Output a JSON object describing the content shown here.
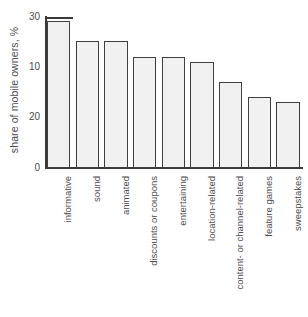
{
  "chart_data": {
    "type": "bar",
    "title": "",
    "subtitle": "",
    "xlabel": "",
    "ylabel": "share of mobile owners, %",
    "ylim": [
      0,
      30
    ],
    "grid": false,
    "legend": "none",
    "y_tick_labels": [
      "30",
      "10",
      "20",
      "0"
    ],
    "y_tick_values": [
      30,
      10,
      20,
      0
    ],
    "categories": [
      "informative",
      "sound",
      "animated",
      "discounts or coupons",
      "entertaining",
      "location-related",
      "content- or channel-related",
      "feature games",
      "sweepstakes"
    ],
    "values": [
      29,
      25,
      25,
      22,
      22,
      21,
      17,
      14,
      13
    ],
    "bar_fill_color": "#f1f1f1",
    "bar_border_color": "#3f3f3f",
    "axis_color": "#3a3a3a",
    "text_color": "#4d4d4d",
    "background_color": "#ffffff"
  }
}
